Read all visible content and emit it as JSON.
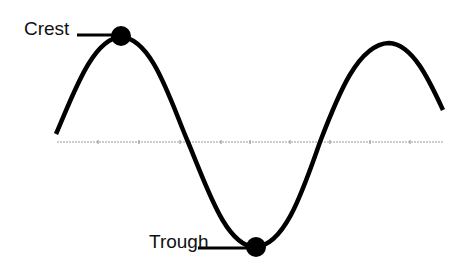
{
  "diagram": {
    "type": "transverse-wave",
    "labels": {
      "crest": "Crest",
      "trough": "Trough"
    },
    "colors": {
      "wave": "#000000",
      "axis": "#9a9a9a",
      "text": "#111111",
      "background": "#ffffff"
    }
  }
}
